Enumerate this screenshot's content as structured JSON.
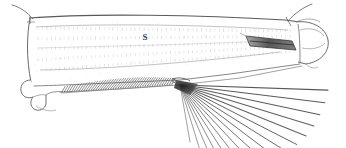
{
  "figure": {
    "kind": "scientific-line-drawing",
    "background_color": "#ffffff",
    "ink_color": "#4a4a4a",
    "dark_ink_color": "#2b2b2b",
    "light_ink_color": "#9a9a9a",
    "width": 346,
    "height": 148
  },
  "labels": {
    "segment_label": "S",
    "segment_label_x": 145,
    "segment_label_y": 40
  },
  "structures": {
    "body_outline_name": "segment body outline",
    "inner_membrane_name": "inner membrane field",
    "texture_name": "vertical striation hatching",
    "basal_hook_name": "basal hook lobe",
    "setal_comb_name": "ventral setal comb",
    "dark_wedge_name": "distal dark spine",
    "apical_cap_name": "apical rounded cap",
    "bristle_fan_name": "apical bristle fan",
    "proximal_seta_name": "proximal dorsal seta",
    "distal_seta_name": "distal dorsal seta"
  },
  "bristle_fan": {
    "origin_x": 180,
    "origin_y": 85,
    "count": 16,
    "angles_deg": [
      2,
      7,
      12,
      17,
      22,
      27,
      32,
      37,
      42,
      47,
      52,
      57,
      62,
      67,
      73,
      80
    ],
    "lengths": [
      148,
      146,
      143,
      140,
      136,
      131,
      126,
      120,
      114,
      107,
      100,
      93,
      85,
      77,
      68,
      58
    ]
  },
  "setal_comb": {
    "start_x": 62,
    "start_y": 92,
    "end_x": 172,
    "end_y": 84,
    "count": 46,
    "seta_length": 8
  },
  "texture_rows": {
    "count": 5,
    "ticks_per_row": 58
  }
}
